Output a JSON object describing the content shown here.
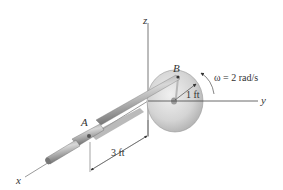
{
  "diagram": {
    "axes": {
      "x_label": "x",
      "y_label": "y",
      "z_label": "z"
    },
    "points": {
      "A": "A",
      "B": "B"
    },
    "annotations": {
      "omega": "ω = 2 rad/s",
      "radius": "1 ft",
      "length": "3 ft"
    },
    "colors": {
      "axis": "#555555",
      "disc_light": "#e4e4e4",
      "disc_dark": "#a8a8a8",
      "rod_light": "#c8c8c8",
      "rod_dark": "#6e6e6e",
      "text": "#333333"
    }
  }
}
